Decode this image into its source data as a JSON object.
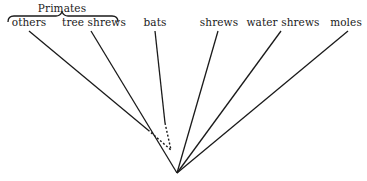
{
  "diagram": {
    "type": "phylogenetic-tree",
    "group_label": "Primates",
    "taxa": [
      {
        "id": "others",
        "label": "others",
        "x": 29,
        "solid_end": [
          148,
          130
        ],
        "dotted": true
      },
      {
        "id": "tree-shrews",
        "label": "tree shrews",
        "x": 92,
        "dotted": false
      },
      {
        "id": "bats",
        "label": "bats",
        "x": 155,
        "solid_end": [
          165,
          123
        ],
        "dotted": true
      },
      {
        "id": "shrews",
        "label": "shrews",
        "x": 219,
        "dotted": false
      },
      {
        "id": "water-shrews",
        "label": "water shrews",
        "x": 283,
        "dotted": false
      },
      {
        "id": "moles",
        "label": "moles",
        "x": 346,
        "dotted": false
      }
    ],
    "root": [
      177,
      173
    ],
    "dotted_join": [
      171,
      150
    ],
    "line_color": "#1a1a1a"
  }
}
